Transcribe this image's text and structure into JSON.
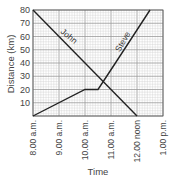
{
  "chart_data": {
    "type": "line",
    "title": "",
    "xlabel": "Time",
    "ylabel": "Distance (km)",
    "x_ticks": [
      "8.00 a.m.",
      "9.00 a.m.",
      "10.00 a.m.",
      "11.00 a.m.",
      "12.00 noon",
      "1.00 p.m."
    ],
    "x_range_hours": [
      8,
      13
    ],
    "y_ticks": [
      10,
      20,
      30,
      40,
      50,
      60,
      70,
      80
    ],
    "ylim": [
      0,
      80
    ],
    "grid": true,
    "legend": "inline labels on lines",
    "series": [
      {
        "name": "John",
        "points": [
          {
            "x": 8.0,
            "y": 80
          },
          {
            "x": 12.0,
            "y": 0
          }
        ]
      },
      {
        "name": "Steve",
        "points": [
          {
            "x": 8.0,
            "y": 0
          },
          {
            "x": 10.0,
            "y": 20
          },
          {
            "x": 10.5,
            "y": 20
          },
          {
            "x": 11.17,
            "y": 40
          },
          {
            "x": 12.5,
            "y": 80
          }
        ]
      }
    ]
  },
  "colors": {
    "line": "#222222",
    "grid_minor": "#cfcfcf",
    "grid_major": "#9a9a9a"
  }
}
